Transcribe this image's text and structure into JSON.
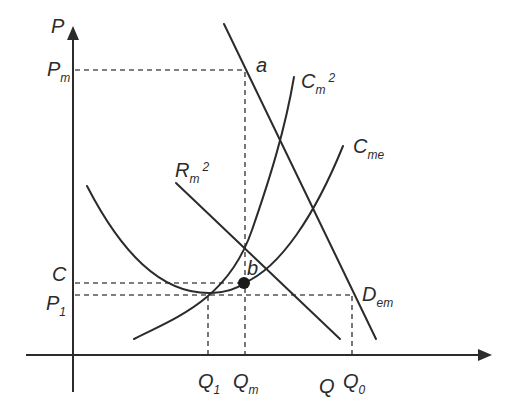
{
  "diagram": {
    "colors": {
      "line": "#2b2b2b",
      "guide": "#555555",
      "background": "#ffffff",
      "point": "#1a1a1a"
    },
    "axes": {
      "y_label": "P",
      "x_label": "Q"
    },
    "y_ticks": [
      {
        "main": "P",
        "sub": "m"
      },
      {
        "main": "C",
        "sub": ""
      },
      {
        "main": "P",
        "sub": "1"
      }
    ],
    "x_ticks": [
      {
        "main": "Q",
        "sub": "1"
      },
      {
        "main": "Q",
        "sub": "m"
      },
      {
        "main": "Q",
        "sub": "0"
      }
    ],
    "curves": {
      "demand": {
        "main": "D",
        "sub": "em"
      },
      "marginal_revenue": {
        "main": "R",
        "sub": "m",
        "sup": "2"
      },
      "marginal_cost": {
        "main": "C",
        "sub": "m",
        "sup": "2"
      },
      "average_cost": {
        "main": "C",
        "sub": "me"
      }
    },
    "points": {
      "a": "a",
      "b": "b"
    }
  }
}
